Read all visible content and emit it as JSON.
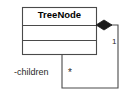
{
  "diagram": {
    "kind": "uml-class-diagram",
    "background_color": "#ffffff",
    "line_color": "#3a3a3a",
    "text_color": "#1a1a1a"
  },
  "classes": [
    {
      "name": "TreeNode",
      "attributes": [],
      "operations": [],
      "compartments": 3,
      "box": {
        "x": 22,
        "y": 7,
        "width": 75,
        "height": 48
      },
      "dividers_y": [
        25,
        40
      ]
    }
  ],
  "relationships": [
    {
      "type": "composition",
      "source": "TreeNode",
      "target": "TreeNode",
      "self_referential": true,
      "diamond": {
        "filled": true,
        "fill_color": "#1a1a1a",
        "center_x": 104,
        "center_y": 25,
        "half_width": 8,
        "half_height": 5
      },
      "source_end": {
        "multiplicity": "1",
        "role": ""
      },
      "target_end": {
        "multiplicity": "*",
        "role": "-children"
      },
      "path": "M 112 25 L 118 25 L 118 88 L 62 88 L 62 55"
    }
  ],
  "labels": {
    "class_name": "TreeNode",
    "role_children": "-children",
    "multiplicity_one": "1",
    "multiplicity_many": "*"
  }
}
